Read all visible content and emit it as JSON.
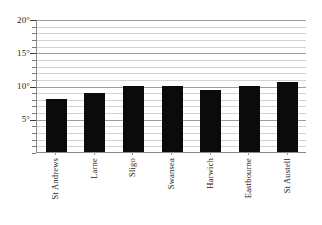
{
  "chart_data": {
    "type": "bar",
    "title": "",
    "subtitle": "",
    "xlabel": "",
    "ylabel": "",
    "categories": [
      "St Andrews",
      "Larne",
      "Sligo",
      "Swansea",
      "Harwich",
      "Eastbourne",
      "St Austell"
    ],
    "values": [
      8.0,
      8.8,
      10.0,
      10.0,
      9.3,
      10.0,
      10.5
    ],
    "series": [
      {
        "name": "Mean temperature",
        "values": [
          8.0,
          8.8,
          10.0,
          10.0,
          9.3,
          10.0,
          10.5
        ]
      }
    ],
    "ylim": [
      0,
      20
    ],
    "y_major_ticks": [
      5,
      10,
      15,
      20
    ],
    "y_major_tick_labels": [
      "5°",
      "10°",
      "15°",
      "20°"
    ],
    "y_minor_tick_step": 1,
    "grid": true,
    "grid_axis": "y",
    "legend": false,
    "legend_position": "none",
    "bar_color": "#0b0b0b",
    "gridline_color": "#d2d2d2",
    "axis_color": "#8a8a8a",
    "background_color": "#ffffff",
    "units": "degrees"
  },
  "axes": {
    "y_ticks": [
      {
        "label": "20°",
        "value": 20
      },
      {
        "label": "15°",
        "value": 15
      },
      {
        "label": "10°",
        "value": 10
      },
      {
        "label": "5°",
        "value": 5
      }
    ]
  }
}
